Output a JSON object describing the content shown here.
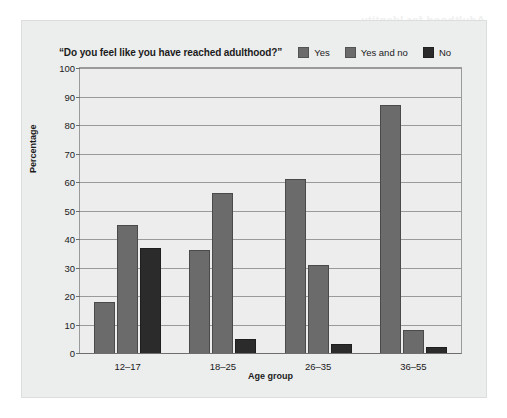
{
  "figure": {
    "background_color": "#ffffff",
    "panel_color": "#eceded",
    "bleed_text": "Adulthood for Identity"
  },
  "chart_data": {
    "type": "bar",
    "title": "“Do you feel like you have reached adulthood?”",
    "xlabel": "Age group",
    "ylabel": "Percentage",
    "ylim": [
      0,
      100
    ],
    "ytick_step": 10,
    "yticks": [
      "0",
      "10",
      "20",
      "30",
      "40",
      "50",
      "60",
      "70",
      "80",
      "90",
      "100"
    ],
    "grid": true,
    "legend_position": "top",
    "categories": [
      "12–17",
      "18–25",
      "26–35",
      "36–55"
    ],
    "series": [
      {
        "name": "Yes",
        "color": "#6b6b6b",
        "values": [
          18,
          36,
          61,
          87
        ]
      },
      {
        "name": "Yes and no",
        "color": "#6b6b6b",
        "values": [
          45,
          56,
          31,
          8
        ]
      },
      {
        "name": "No",
        "color": "#2b2b2b",
        "values": [
          37,
          5,
          3,
          2
        ]
      }
    ]
  }
}
